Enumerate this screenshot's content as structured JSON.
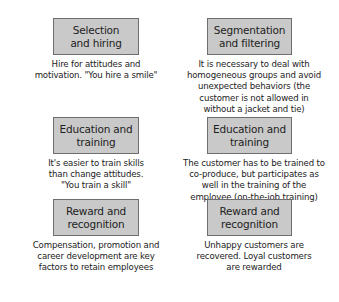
{
  "diagram": {
    "colors": {
      "box_fill": "#c9c9c9",
      "box_border": "#6e6e6e",
      "text": "#222222",
      "background": "#ffffff"
    },
    "columns": [
      {
        "side": "left",
        "items": [
          {
            "title_line1": "Selection",
            "title_line2": "and hiring",
            "desc_lines": [
              "Hire for attitudes and",
              "motivation. \"You hire a smile\""
            ]
          },
          {
            "title_line1": "Education and",
            "title_line2": "training",
            "desc_lines": [
              "It's easier to train skills",
              "than change attitudes.",
              "\"You train a skill\""
            ]
          },
          {
            "title_line1": "Reward and",
            "title_line2": "recognition",
            "desc_lines": [
              "Compensation, promotion and",
              "career development are key",
              "factors to retain employees"
            ]
          }
        ]
      },
      {
        "side": "right",
        "items": [
          {
            "title_line1": "Segmentation",
            "title_line2": "and filtering",
            "desc_lines": [
              "It is necessary to deal with",
              "homogeneous groups and avoid",
              "unexpected behaviors (the",
              "customer is not allowed in",
              "without a jacket and tie)"
            ]
          },
          {
            "title_line1": "Education and",
            "title_line2": "training",
            "desc_lines": [
              "The customer has to be trained to",
              "co-produce, but participates as",
              "well in the training of the",
              "employee (on-the-job training)"
            ]
          },
          {
            "title_line1": "Reward and",
            "title_line2": "recognition",
            "desc_lines": [
              "Unhappy customers are",
              "recovered. Loyal customers",
              "are rewarded"
            ]
          }
        ]
      }
    ]
  }
}
